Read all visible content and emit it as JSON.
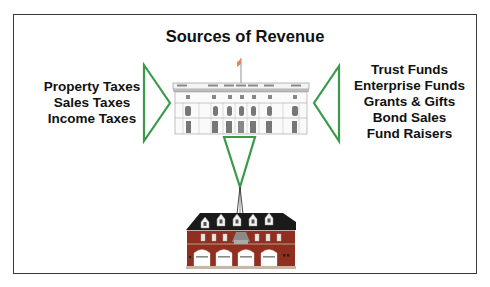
{
  "title": "Sources of Revenue",
  "left_sources": [
    "Property Taxes",
    "Sales Taxes",
    "Income Taxes"
  ],
  "right_sources": [
    "Trust Funds",
    "Enterprise Funds",
    "Grants & Gifts",
    "Bond Sales",
    "Fund Raisers"
  ],
  "colors": {
    "arrow_green": "#3a9a4a",
    "frame": "#3a3a3a",
    "brick": "#8e2f1f",
    "roof": "#1a1a1a"
  },
  "illustrations": {
    "top_building": "town-hall",
    "bottom_building": "fire-station"
  }
}
